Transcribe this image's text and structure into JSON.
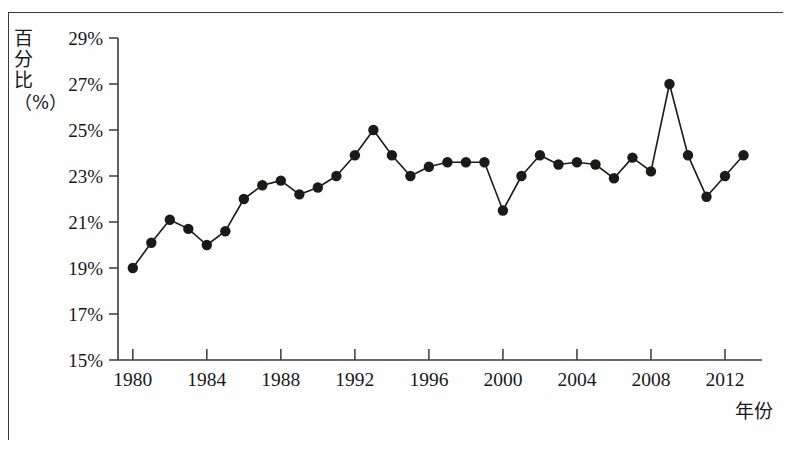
{
  "figure": {
    "ylabel_chars": [
      "百",
      "分",
      "比"
    ],
    "ylabel_unit": "（%）",
    "xlabel": "年份"
  },
  "chart_data": {
    "type": "line",
    "title": "",
    "subtitle": "",
    "xlabel": "年份",
    "ylabel": "百分比（%）",
    "grid": false,
    "legend": "none",
    "marker": "filled-circle",
    "xlim": [
      1979.2,
      2014.0
    ],
    "ylim": [
      15,
      29
    ],
    "ytick_labels": [
      "29%",
      "27%",
      "25%",
      "23%",
      "21%",
      "19%",
      "17%",
      "15%"
    ],
    "ytick_values": [
      29,
      27,
      25,
      23,
      21,
      19,
      17,
      15
    ],
    "yminor_present": false,
    "xtick_labels": [
      "1980",
      "1984",
      "1988",
      "1992",
      "1996",
      "2000",
      "2004",
      "2008",
      "2012"
    ],
    "xtick_values": [
      1980,
      1984,
      1988,
      1992,
      1996,
      2000,
      2004,
      2008,
      2012
    ],
    "x": [
      1980,
      1981,
      1982,
      1983,
      1984,
      1985,
      1986,
      1987,
      1988,
      1989,
      1990,
      1991,
      1992,
      1993,
      1994,
      1995,
      1996,
      1997,
      1998,
      1999,
      2000,
      2001,
      2002,
      2003,
      2004,
      2005,
      2006,
      2007,
      2008,
      2009,
      2010,
      2011,
      2012,
      2013
    ],
    "values": [
      19.0,
      20.1,
      21.1,
      20.7,
      20.0,
      20.6,
      22.0,
      22.6,
      22.8,
      22.2,
      22.5,
      23.0,
      23.9,
      25.0,
      23.9,
      23.0,
      23.4,
      23.6,
      23.6,
      23.6,
      21.5,
      23.0,
      23.9,
      23.5,
      23.6,
      23.5,
      22.9,
      23.8,
      23.2,
      27.0,
      23.9,
      22.1,
      23.0,
      23.9
    ],
    "series": [
      {
        "name": "百分比",
        "color": "#1b1a18",
        "values": [
          19.0,
          20.1,
          21.1,
          20.7,
          20.0,
          20.6,
          22.0,
          22.6,
          22.8,
          22.2,
          22.5,
          23.0,
          23.9,
          25.0,
          23.9,
          23.0,
          23.4,
          23.6,
          23.6,
          23.6,
          21.5,
          23.0,
          23.9,
          23.5,
          23.6,
          23.5,
          22.9,
          23.8,
          23.2,
          27.0,
          23.9,
          22.1,
          23.0,
          23.9
        ]
      }
    ],
    "annotations": {
      "peak_year": 2009,
      "peak_value": 27.0,
      "min_year": 1980,
      "min_value": 19.0
    },
    "colors": {
      "line": "#1b1a18",
      "marker": "#1b1a18",
      "axis": "#3a3a3a",
      "background": "#fefefe"
    }
  }
}
